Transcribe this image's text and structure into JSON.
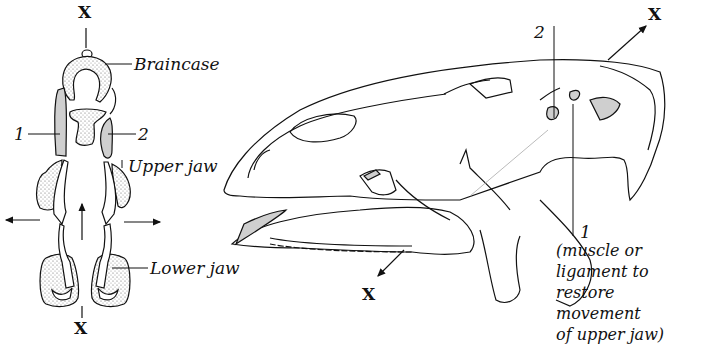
{
  "figure": {
    "top_view": {
      "x_top": "X",
      "x_bottom": "X",
      "labels": {
        "braincase": "Braincase",
        "one": "1",
        "two": "2",
        "upper_jaw": "Upper jaw",
        "lower_jaw": "Lower jaw"
      }
    },
    "side_view": {
      "x_top": "X",
      "x_bottom": "X",
      "labels": {
        "two": "2",
        "one": "1",
        "note_lines": [
          "(muscle or",
          "ligament to",
          "restore movement",
          "of upper jaw)"
        ]
      }
    },
    "colors": {
      "line": "#111111",
      "highlight_fill": "#cfcfcf",
      "stipple_fill": "#e2e2e2"
    }
  }
}
